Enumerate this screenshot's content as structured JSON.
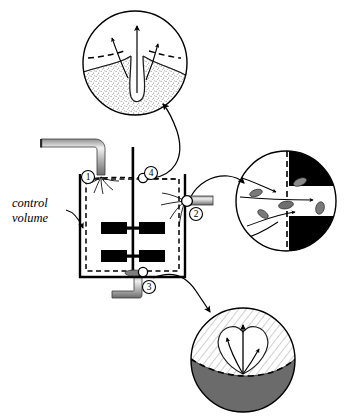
{
  "figure": {
    "type": "engineering-schematic",
    "width": 347,
    "height": 417,
    "background_color": "#ffffff",
    "line_color": "#000000"
  },
  "labels": {
    "control_volume_line1": "control",
    "control_volume_line2": "volume"
  },
  "callouts": [
    {
      "id": "1",
      "number": "1",
      "name": "inlet-stream-callout",
      "location": "top-left liquid surface, feed pipe entry",
      "cx": 88,
      "cy": 177,
      "r": 6.5
    },
    {
      "id": "2",
      "number": "2",
      "name": "outlet-stream-callout",
      "location": "right wall discharge port",
      "cx": 196,
      "cy": 214,
      "r": 6.5
    },
    {
      "id": "3",
      "number": "3",
      "name": "drain-stream-callout",
      "location": "tank floor drain",
      "cx": 149,
      "cy": 287,
      "r": 6.5
    },
    {
      "id": "4",
      "number": "4",
      "name": "free-surface-callout",
      "location": "liquid free surface at shaft",
      "cx": 151,
      "cy": 173,
      "r": 6.5
    }
  ],
  "tank": {
    "name": "stirred-tank-vessel",
    "wall_color": "#000000",
    "boundary_style": "dashed",
    "boundary_color": "#000000",
    "impeller_count": 2,
    "blades_per_impeller": 2,
    "blade_color": "#000000",
    "shaft": "vertical-center-shaft"
  },
  "pipes": {
    "inlet": {
      "name": "inlet-pipe",
      "orientation": "L-shape from left, turning downward",
      "fill": "metallic-gray-gradient"
    },
    "outlet": {
      "name": "outlet-pipe",
      "orientation": "horizontal to the right of tank wall",
      "fill": "metallic-gray-gradient"
    },
    "drain": {
      "name": "drain-pipe",
      "orientation": "downward then left from tank floor",
      "fill": "metallic-gray-gradient"
    }
  },
  "insets": [
    {
      "id": "top",
      "name": "inset-free-surface-vortex",
      "cx": 135,
      "cy": 63,
      "r": 52,
      "description": "Free surface vortex dimple crossing the dashed control surface",
      "fill_texture": "stippled-liquid",
      "boundary_style": "dashed",
      "arrow_count": 3,
      "arrow_direction": "upward-outward"
    },
    {
      "id": "right",
      "name": "inset-outlet-port",
      "cx": 286,
      "cy": 201,
      "r": 50,
      "description": "Flow of fluid and suspended particles through the outlet port across the dashed control surface",
      "wall_color": "#000000",
      "particle_color": "#7a7a7a",
      "boundary_style": "dashed",
      "arrow_count": 4,
      "arrow_direction": "left-to-right"
    },
    {
      "id": "bottom",
      "name": "inset-floor-drain-plume",
      "cx": 243,
      "cy": 360,
      "r": 52,
      "description": "Plume leaving the tank floor through the dashed control surface",
      "upper_texture": "diagonal-hatch",
      "lower_fill": "#6b6b6b",
      "boundary_style": "dashed",
      "arrow_count": 3,
      "arrow_direction": "upward"
    }
  ],
  "leader_arrows": [
    {
      "name": "leader-callout-4-to-top-inset",
      "from": "callout-4",
      "to": "inset-top"
    },
    {
      "name": "leader-callout-2-to-right-inset",
      "from": "callout-2",
      "to": "inset-right"
    },
    {
      "name": "leader-callout-3-to-bottom-inset",
      "from": "callout-3",
      "to": "inset-bottom"
    },
    {
      "name": "leader-control-volume-label",
      "from": "control-volume-label",
      "to": "tank-left-boundary"
    }
  ]
}
